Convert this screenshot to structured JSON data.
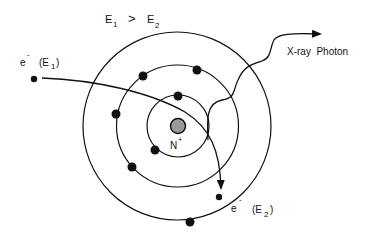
{
  "title": {
    "e1_main": "E",
    "e1_sub": "1",
    "relation": ">",
    "e2_main": "E",
    "e2_sub": "2"
  },
  "incoming_electron": {
    "symbol": "e",
    "charge": "-",
    "energy_open": "(E",
    "energy_sub": "1",
    "energy_close": ")"
  },
  "outgoing_electron": {
    "symbol": "e",
    "charge": "-",
    "energy_open": "(E",
    "energy_sub": "2",
    "energy_close": ")"
  },
  "nucleus": {
    "label": "N",
    "charge": "+",
    "fill": "#9a9a9a"
  },
  "photon": {
    "label": "X-ray  Photon"
  },
  "colors": {
    "line": "#111111",
    "electron": "#111111",
    "nucleus": "#9a9a9a"
  }
}
